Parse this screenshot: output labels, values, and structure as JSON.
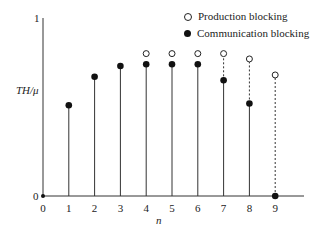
{
  "chart_data": {
    "type": "scatter",
    "subtype": "stem",
    "title": "",
    "xlabel": "n",
    "ylabel": "TH/μ",
    "x": [
      0,
      1,
      2,
      3,
      4,
      5,
      6,
      7,
      8,
      9
    ],
    "ylim": [
      0,
      1
    ],
    "y_tick_labels": [
      "0",
      "1"
    ],
    "x_tick_labels": [
      "0",
      "1",
      "2",
      "3",
      "4",
      "5",
      "6",
      "7",
      "8",
      "9"
    ],
    "grid": false,
    "legend_position": "top-right",
    "series": [
      {
        "name": "Production blocking",
        "marker": "open-circle",
        "values": [
          null,
          null,
          null,
          null,
          0.8,
          0.8,
          0.8,
          0.8,
          0.77,
          0.68
        ]
      },
      {
        "name": "Communication blocking",
        "marker": "filled-circle",
        "values": [
          0,
          0.51,
          0.67,
          0.73,
          0.74,
          0.74,
          0.74,
          0.65,
          0.52,
          0
        ]
      }
    ],
    "annotations": [
      "Dashed lines connect communication-blocking value up to production-blocking value for n=7,8,9"
    ]
  },
  "labels": {
    "y_top": "1",
    "y_bottom": "0",
    "ylabel": "TH/μ",
    "xlabel": "n",
    "legend_open": "Production blocking",
    "legend_filled": "Communication blocking"
  }
}
